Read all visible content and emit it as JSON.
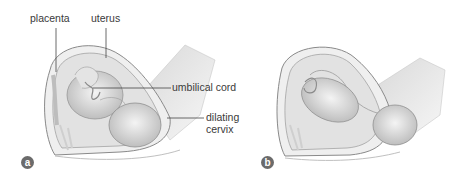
{
  "figure": {
    "panels": [
      {
        "id": "a",
        "badge": "a",
        "labels": {
          "placenta": "placenta",
          "uterus": "uterus",
          "umbilical_cord": "umbilical cord",
          "dilating_cervix_line1": "dilating",
          "dilating_cervix_line2": "cervix"
        }
      },
      {
        "id": "b",
        "badge": "b"
      }
    ],
    "colors": {
      "badge": "#6b6b6b",
      "label_text": "#3a3a3a",
      "leader_line": "#444444"
    }
  }
}
